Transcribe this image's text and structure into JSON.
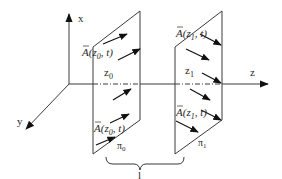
{
  "diagram": {
    "axes": {
      "x_label": "x",
      "y_label": "y",
      "z_label": "z"
    },
    "plane0": {
      "name": "π",
      "name_sub": "0",
      "position_label": "z",
      "position_sub": "0",
      "vector_top": {
        "A": "A",
        "open": "(z",
        "sub": "0",
        "close": ", t)"
      },
      "vector_bottom": {
        "A": "A",
        "open": "(z",
        "sub": "0",
        "close": ", t)"
      }
    },
    "plane1": {
      "name": "π",
      "name_sub": "1",
      "position_label": "z",
      "position_sub": "1",
      "vector_top": {
        "A": "A",
        "open": "(z",
        "sub": "1",
        "close": ", t)"
      },
      "vector_bottom": {
        "A": "A",
        "open": "(z",
        "sub": "1",
        "close": ", t)"
      }
    },
    "brace_label": "l",
    "colors": {
      "line": "#3a3a3a",
      "arrow": "#111111",
      "text": "#2a2a2a",
      "background": "#ffffff"
    }
  }
}
